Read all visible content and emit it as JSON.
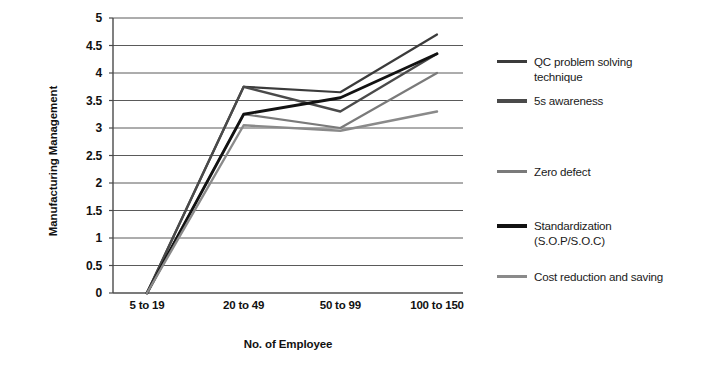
{
  "chart_data": {
    "type": "line",
    "title": "",
    "xlabel": "No. of Employee",
    "ylabel": "Manufacturing Management",
    "categories": [
      "5 to 19",
      "20 to 49",
      "50 to 99",
      "100 to 150"
    ],
    "ylim": [
      0,
      5
    ],
    "yticks": [
      0,
      0.5,
      1,
      1.5,
      2,
      2.5,
      3,
      3.5,
      4,
      4.5,
      5
    ],
    "ytick_labels": [
      "0",
      "0.5",
      "1",
      "1.5",
      "2",
      "2.5",
      "3",
      "3.5",
      "4",
      "4.5",
      "5"
    ],
    "grid": "horizontal",
    "legend_position": "right",
    "markers": "none",
    "series": [
      {
        "name": "QC problem solving technique",
        "values": [
          0,
          3.75,
          3.65,
          4.7
        ],
        "color": "#3b3b3b",
        "width": 2.2
      },
      {
        "name": "5s awareness",
        "values": [
          0,
          3.75,
          3.3,
          4.35
        ],
        "color": "#4a4a4a",
        "width": 2.4
      },
      {
        "name": "Zero defect",
        "values": [
          0,
          3.25,
          3.0,
          4.0
        ],
        "color": "#7a7a7a",
        "width": 2.2
      },
      {
        "name": "Standardization (S.O.P/S.O.C)",
        "values": [
          0,
          3.25,
          3.55,
          4.35
        ],
        "color": "#121212",
        "width": 2.8
      },
      {
        "name": "Cost reduction and saving",
        "values": [
          0,
          3.05,
          2.95,
          3.3
        ],
        "color": "#8a8a8a",
        "width": 2.4
      }
    ]
  },
  "legend": {
    "items": [
      {
        "label": "QC problem solving\ntechnique",
        "color": "#3b3b3b",
        "thickness": 3,
        "top": 14
      },
      {
        "label": "5s awareness",
        "color": "#4a4a4a",
        "thickness": 3.5,
        "top": 53
      },
      {
        "label": "Zero defect",
        "color": "#7a7a7a",
        "thickness": 3,
        "top": 124
      },
      {
        "label": "Standardization\n(S.O.P/S.O.C)",
        "color": "#121212",
        "thickness": 4,
        "top": 178
      },
      {
        "label": "Cost reduction and saving",
        "color": "#8a8a8a",
        "thickness": 3,
        "top": 229
      }
    ]
  },
  "axes": {
    "y_title": "Manufacturing Management",
    "x_title": "No. of Employee"
  },
  "colors": {
    "gridline": "#5a5a5a",
    "axis": "#4a4a4a",
    "text": "#111111",
    "background": "#ffffff"
  }
}
